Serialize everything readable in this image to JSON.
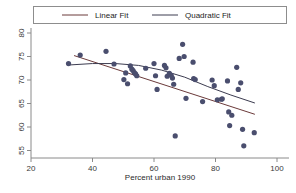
{
  "chart_data": {
    "type": "scatter",
    "title": "",
    "xlabel": "Percent urban 1990",
    "ylabel": "",
    "xlim": [
      20,
      100
    ],
    "ylim": [
      53.5,
      81
    ],
    "xticks": [
      20,
      40,
      60,
      80,
      100
    ],
    "yticks": [
      55,
      60,
      65,
      70,
      75,
      80
    ],
    "xtick_labels": [
      "20",
      "40",
      "60",
      "80",
      "100"
    ],
    "ytick_labels": [
      "55",
      "60",
      "65",
      "70",
      "75",
      "80"
    ],
    "grid": false,
    "legend_position": "top",
    "marker_color": "#4a4e6e",
    "points": [
      {
        "x": 32.2,
        "y": 73.5
      },
      {
        "x": 36.0,
        "y": 75.3
      },
      {
        "x": 44.4,
        "y": 76.1
      },
      {
        "x": 47.0,
        "y": 73.4
      },
      {
        "x": 50.2,
        "y": 70.1
      },
      {
        "x": 50.8,
        "y": 71.5
      },
      {
        "x": 51.4,
        "y": 69.2
      },
      {
        "x": 52.3,
        "y": 73.0
      },
      {
        "x": 52.8,
        "y": 72.3
      },
      {
        "x": 53.2,
        "y": 72.0
      },
      {
        "x": 53.6,
        "y": 71.6
      },
      {
        "x": 54.0,
        "y": 71.3
      },
      {
        "x": 54.4,
        "y": 70.9
      },
      {
        "x": 57.3,
        "y": 72.5
      },
      {
        "x": 60.0,
        "y": 73.5
      },
      {
        "x": 60.5,
        "y": 70.9
      },
      {
        "x": 61.0,
        "y": 68.0
      },
      {
        "x": 63.4,
        "y": 73.1
      },
      {
        "x": 63.9,
        "y": 72.6
      },
      {
        "x": 64.3,
        "y": 70.8
      },
      {
        "x": 65.0,
        "y": 71.4
      },
      {
        "x": 65.6,
        "y": 71.0
      },
      {
        "x": 66.0,
        "y": 70.4
      },
      {
        "x": 66.4,
        "y": 69.1
      },
      {
        "x": 66.9,
        "y": 58.1
      },
      {
        "x": 68.2,
        "y": 74.6
      },
      {
        "x": 69.3,
        "y": 77.6
      },
      {
        "x": 69.8,
        "y": 75.0
      },
      {
        "x": 70.4,
        "y": 66.1
      },
      {
        "x": 72.7,
        "y": 73.8
      },
      {
        "x": 72.9,
        "y": 70.3
      },
      {
        "x": 73.4,
        "y": 70.1
      },
      {
        "x": 75.8,
        "y": 65.4
      },
      {
        "x": 78.9,
        "y": 70.0
      },
      {
        "x": 79.6,
        "y": 68.8
      },
      {
        "x": 80.6,
        "y": 65.8
      },
      {
        "x": 81.9,
        "y": 65.9
      },
      {
        "x": 82.2,
        "y": 66.0
      },
      {
        "x": 83.9,
        "y": 69.8
      },
      {
        "x": 84.3,
        "y": 63.2
      },
      {
        "x": 84.6,
        "y": 60.3
      },
      {
        "x": 85.3,
        "y": 62.5
      },
      {
        "x": 86.9,
        "y": 72.7
      },
      {
        "x": 87.4,
        "y": 68.0
      },
      {
        "x": 88.2,
        "y": 69.4
      },
      {
        "x": 88.8,
        "y": 59.5
      },
      {
        "x": 89.2,
        "y": 56.0
      },
      {
        "x": 92.6,
        "y": 58.8
      }
    ],
    "series": [
      {
        "name": "Linear Fit",
        "type": "line",
        "color": "#6b3a3a",
        "x": [
          34.0,
          92.8
        ],
        "y": [
          75.2,
          62.7
        ]
      },
      {
        "name": "Quadratic Fit",
        "type": "curve",
        "color": "#3c3c50",
        "x": [
          32.5,
          40.0,
          47.5,
          55.0,
          62.5,
          70.0,
          77.5,
          85.0,
          92.8
        ],
        "y": [
          73.2,
          73.5,
          73.5,
          73.1,
          72.1,
          70.6,
          68.6,
          66.8,
          65.1
        ]
      }
    ]
  },
  "legend": {
    "items": [
      {
        "label": "Linear Fit",
        "color": "#6b3a3a"
      },
      {
        "label": "Quadratic Fit",
        "color": "#3c3c50"
      }
    ]
  }
}
